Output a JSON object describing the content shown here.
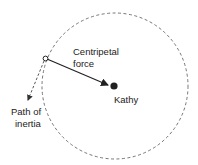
{
  "labels": {
    "force": [
      "Centripetal",
      "force"
    ],
    "person": "Kathy",
    "inertia": [
      "Path of",
      "inertia"
    ]
  },
  "colors": {
    "line": "#555555",
    "arrow": "#222222"
  }
}
